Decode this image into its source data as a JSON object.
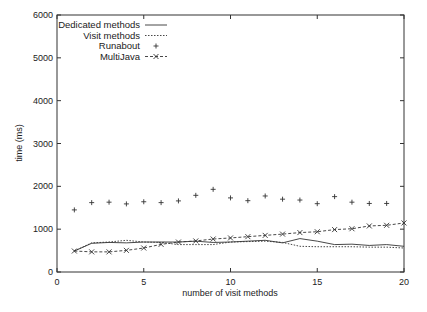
{
  "chart_data": {
    "type": "line",
    "title": "",
    "xlabel": "number of visit methods",
    "ylabel": "time (ms)",
    "xlim": [
      0,
      20
    ],
    "ylim": [
      0,
      6000
    ],
    "xticks": [
      0,
      5,
      10,
      15,
      20
    ],
    "yticks": [
      0,
      1000,
      2000,
      3000,
      4000,
      5000,
      6000
    ],
    "grid": false,
    "legend_position": "top-left",
    "x": [
      1,
      2,
      3,
      4,
      5,
      6,
      7,
      8,
      9,
      10,
      11,
      12,
      13,
      14,
      15,
      16,
      17,
      18,
      19,
      20
    ],
    "series": [
      {
        "name": "Dedicated methods",
        "style": "solid-line",
        "values": [
          490,
          670,
          690,
          680,
          700,
          700,
          700,
          720,
          690,
          700,
          720,
          740,
          680,
          780,
          720,
          640,
          650,
          620,
          640,
          600
        ]
      },
      {
        "name": "Visit methods",
        "style": "dotted-line",
        "values": [
          490,
          680,
          700,
          740,
          700,
          690,
          640,
          640,
          640,
          700,
          710,
          720,
          690,
          600,
          590,
          590,
          590,
          580,
          580,
          560
        ]
      },
      {
        "name": "Runabout",
        "style": "plus-points",
        "values": [
          1450,
          1620,
          1630,
          1590,
          1640,
          1620,
          1660,
          1790,
          1930,
          1730,
          1665,
          1775,
          1700,
          1680,
          1595,
          1760,
          1630,
          1600,
          1600,
          null
        ]
      },
      {
        "name": "MultiJava",
        "style": "dashed-line-x-points",
        "values": [
          490,
          470,
          470,
          505,
          560,
          645,
          700,
          725,
          770,
          795,
          825,
          855,
          885,
          920,
          940,
          990,
          1010,
          1075,
          1090,
          1145
        ]
      }
    ]
  },
  "labels": {
    "xlabel": "number of visit methods",
    "ylabel": "time (ms)",
    "yticks": [
      "0",
      "1000",
      "2000",
      "3000",
      "4000",
      "5000",
      "6000"
    ],
    "xticks": [
      "0",
      "5",
      "10",
      "15",
      "20"
    ],
    "legend": [
      "Dedicated methods",
      "Visit methods",
      "Runabout",
      "MultiJava"
    ]
  },
  "colors": {
    "ink": "#333333",
    "background": "#ffffff"
  }
}
